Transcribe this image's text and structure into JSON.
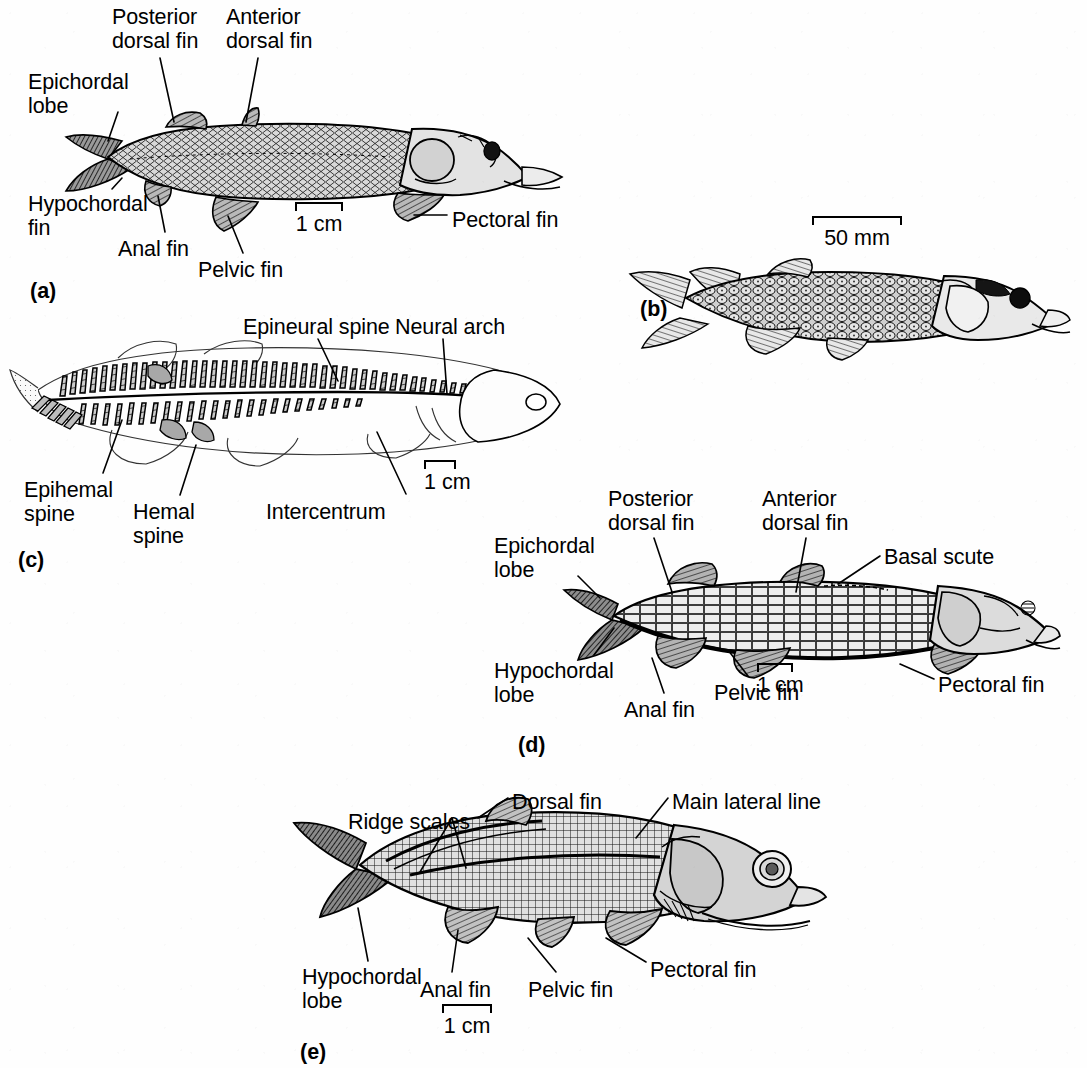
{
  "figure": {
    "type": "scientific-illustration-plate",
    "background_color": "#ffffff",
    "ink_color": "#000000",
    "panel_count": 5
  },
  "panels": [
    {
      "id": "(a)",
      "id_x": 30,
      "id_y": 279,
      "scale_bar": {
        "label": "1 cm",
        "x": 295,
        "y": 202,
        "width": 48
      },
      "labels": [
        {
          "key": "posterior_dorsal_fin",
          "text": "Posterior\ndorsal fin",
          "x": 112,
          "y": 5,
          "align": "left"
        },
        {
          "key": "anterior_dorsal_fin",
          "text": "Anterior\ndorsal fin",
          "x": 226,
          "y": 5,
          "align": "left"
        },
        {
          "key": "epichordal_lobe",
          "text": "Epichordal\nlobe",
          "x": 28,
          "y": 70,
          "align": "left"
        },
        {
          "key": "hypochordal_fin",
          "text": "Hypochordal\nfin",
          "x": 28,
          "y": 192,
          "align": "left"
        },
        {
          "key": "anal_fin",
          "text": "Anal fin",
          "x": 118,
          "y": 237,
          "align": "left"
        },
        {
          "key": "pelvic_fin",
          "text": "Pelvic fin",
          "x": 198,
          "y": 258,
          "align": "left"
        },
        {
          "key": "pectoral_fin",
          "text": "Pectoral fin",
          "x": 452,
          "y": 208,
          "align": "left"
        }
      ],
      "leaders": [
        {
          "key": "posterior_dorsal_fin_leader",
          "x1": 160,
          "y1": 58,
          "x2": 174,
          "y2": 122
        },
        {
          "key": "anterior_dorsal_fin_leader",
          "x1": 258,
          "y1": 58,
          "x2": 246,
          "y2": 122
        },
        {
          "key": "epichordal_lobe_leader",
          "x1": 118,
          "y1": 112,
          "x2": 108,
          "y2": 141
        },
        {
          "key": "hypochordal_fin_leader",
          "x1": 112,
          "y1": 189,
          "x2": 122,
          "y2": 178
        },
        {
          "key": "anal_fin_leader",
          "x1": 165,
          "y1": 232,
          "x2": 158,
          "y2": 196
        },
        {
          "key": "pelvic_fin_leader",
          "x1": 243,
          "y1": 253,
          "x2": 228,
          "y2": 216
        },
        {
          "key": "pectoral_fin_leader",
          "x1": 447,
          "y1": 215,
          "x2": 414,
          "y2": 215
        }
      ]
    },
    {
      "id": "(b)",
      "id_x": 640,
      "id_y": 297,
      "scale_bar": {
        "label": "50 mm",
        "x": 812,
        "y": 216,
        "width": 90
      },
      "labels": [],
      "leaders": []
    },
    {
      "id": "(c)",
      "id_x": 18,
      "id_y": 548,
      "scale_bar": {
        "label": "1 cm",
        "x": 424,
        "y": 460,
        "width": 32
      },
      "labels": [
        {
          "key": "epineural_spine",
          "text": "Epineural spine",
          "x": 243,
          "y": 315,
          "align": "left"
        },
        {
          "key": "neural_arch",
          "text": "Neural arch",
          "x": 395,
          "y": 315,
          "align": "left"
        },
        {
          "key": "epihemal_spine",
          "text": "Epihemal\nspine",
          "x": 24,
          "y": 478,
          "align": "left"
        },
        {
          "key": "hemal_spine",
          "text": "Hemal\nspine",
          "x": 133,
          "y": 500,
          "align": "left"
        },
        {
          "key": "intercentrum",
          "text": "Intercentrum",
          "x": 266,
          "y": 500,
          "align": "left"
        }
      ],
      "leaders": [
        {
          "key": "epineural_spine_leader",
          "x1": 318,
          "y1": 339,
          "x2": 338,
          "y2": 381
        },
        {
          "key": "neural_arch_leader",
          "x1": 443,
          "y1": 339,
          "x2": 447,
          "y2": 394
        },
        {
          "key": "epihemal_spine_leader",
          "x1": 103,
          "y1": 473,
          "x2": 122,
          "y2": 420
        },
        {
          "key": "hemal_spine_leader",
          "x1": 180,
          "y1": 495,
          "x2": 196,
          "y2": 445
        },
        {
          "key": "intercentrum_leader",
          "x1": 406,
          "y1": 494,
          "x2": 377,
          "y2": 432
        }
      ]
    },
    {
      "id": "(d)",
      "id_x": 518,
      "id_y": 733,
      "scale_bar": {
        "label": "1 cm",
        "x": 757,
        "y": 663,
        "width": 36
      },
      "labels": [
        {
          "key": "posterior_dorsal_fin",
          "text": "Posterior\ndorsal fin",
          "x": 608,
          "y": 487,
          "align": "left"
        },
        {
          "key": "anterior_dorsal_fin",
          "text": "Anterior\ndorsal fin",
          "x": 762,
          "y": 487,
          "align": "left"
        },
        {
          "key": "epichordal_lobe",
          "text": "Epichordal\nlobe",
          "x": 494,
          "y": 534,
          "align": "left"
        },
        {
          "key": "basal_scute",
          "text": "Basal scute",
          "x": 884,
          "y": 545,
          "align": "left"
        },
        {
          "key": "hypochordal_lobe",
          "text": "Hypochordal\nlobe",
          "x": 494,
          "y": 659,
          "align": "left"
        },
        {
          "key": "anal_fin",
          "text": "Anal fin",
          "x": 624,
          "y": 698,
          "align": "left"
        },
        {
          "key": "pelvic_fin",
          "text": "Pelvic fin",
          "x": 714,
          "y": 681,
          "align": "left"
        },
        {
          "key": "pectoral_fin",
          "text": "Pectoral fin",
          "x": 938,
          "y": 673,
          "align": "left"
        }
      ],
      "leaders": [
        {
          "key": "posterior_dorsal_fin_leader",
          "x1": 654,
          "y1": 538,
          "x2": 672,
          "y2": 592
        },
        {
          "key": "anterior_dorsal_fin_leader",
          "x1": 806,
          "y1": 538,
          "x2": 796,
          "y2": 592
        },
        {
          "key": "epichordal_lobe_leader",
          "x1": 578,
          "y1": 576,
          "x2": 600,
          "y2": 598
        },
        {
          "key": "basal_scute_leader",
          "x1": 880,
          "y1": 556,
          "x2": 838,
          "y2": 584
        },
        {
          "key": "hypochordal_lobe_leader",
          "x1": 594,
          "y1": 655,
          "x2": 614,
          "y2": 628
        },
        {
          "key": "anal_fin_leader",
          "x1": 664,
          "y1": 693,
          "x2": 652,
          "y2": 658
        },
        {
          "key": "pelvic_fin_leader",
          "x1": 748,
          "y1": 676,
          "x2": 728,
          "y2": 650
        },
        {
          "key": "pectoral_fin_leader",
          "x1": 934,
          "y1": 679,
          "x2": 900,
          "y2": 664
        }
      ]
    },
    {
      "id": "(e)",
      "id_x": 300,
      "id_y": 1040,
      "scale_bar": {
        "label": "1 cm",
        "x": 442,
        "y": 1004,
        "width": 50
      },
      "labels": [
        {
          "key": "ridge_scales",
          "text": "Ridge scales",
          "x": 348,
          "y": 810,
          "align": "left"
        },
        {
          "key": "dorsal_fin",
          "text": "Dorsal fin",
          "x": 512,
          "y": 790,
          "align": "left"
        },
        {
          "key": "main_lateral_line",
          "text": "Main lateral line",
          "x": 672,
          "y": 790,
          "align": "left"
        },
        {
          "key": "hypochordal_lobe",
          "text": "Hypochordal\nlobe",
          "x": 302,
          "y": 965,
          "align": "left"
        },
        {
          "key": "anal_fin",
          "text": "Anal fin",
          "x": 420,
          "y": 978,
          "align": "left"
        },
        {
          "key": "pelvic_fin",
          "text": "Pelvic fin",
          "x": 528,
          "y": 978,
          "align": "left"
        },
        {
          "key": "pectoral_fin",
          "text": "Pectoral fin",
          "x": 650,
          "y": 958,
          "align": "left"
        }
      ],
      "leaders": [
        {
          "key": "ridge_scales_leader_1",
          "x1": 452,
          "y1": 818,
          "x2": 420,
          "y2": 872
        },
        {
          "key": "ridge_scales_leader_2",
          "x1": 452,
          "y1": 818,
          "x2": 466,
          "y2": 868
        },
        {
          "key": "dorsal_fin_leader",
          "x1": 508,
          "y1": 798,
          "x2": 478,
          "y2": 818
        },
        {
          "key": "main_lateral_line_leader",
          "x1": 668,
          "y1": 798,
          "x2": 636,
          "y2": 838
        },
        {
          "key": "hypochordal_lobe_leader",
          "x1": 368,
          "y1": 961,
          "x2": 358,
          "y2": 908
        },
        {
          "key": "anal_fin_leader",
          "x1": 452,
          "y1": 972,
          "x2": 458,
          "y2": 930
        },
        {
          "key": "pelvic_fin_leader",
          "x1": 556,
          "y1": 972,
          "x2": 528,
          "y2": 938
        },
        {
          "key": "pectoral_fin_leader",
          "x1": 646,
          "y1": 962,
          "x2": 606,
          "y2": 938
        }
      ]
    }
  ]
}
